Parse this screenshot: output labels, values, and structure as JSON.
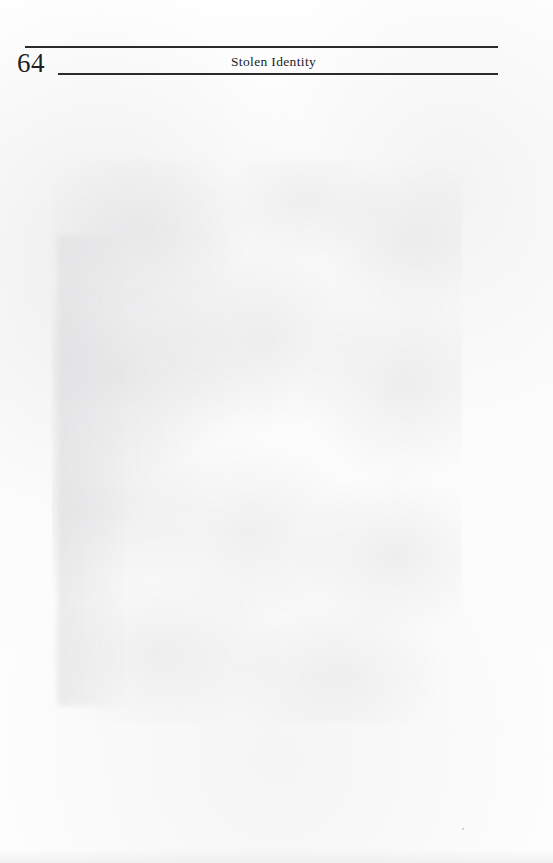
{
  "document": {
    "kind": "scanned-book-page",
    "page_background_color": "#fdfdfd",
    "ink_color": "#1f1f1f",
    "rule_color": "#2b2b2b"
  },
  "header": {
    "folio": "64",
    "running_head": "Stolen Identity",
    "rules": [
      {
        "name": "upper-rule"
      },
      {
        "name": "lower-rule"
      }
    ]
  },
  "body": {
    "text": "",
    "note": ""
  },
  "footer": {
    "text": ""
  }
}
